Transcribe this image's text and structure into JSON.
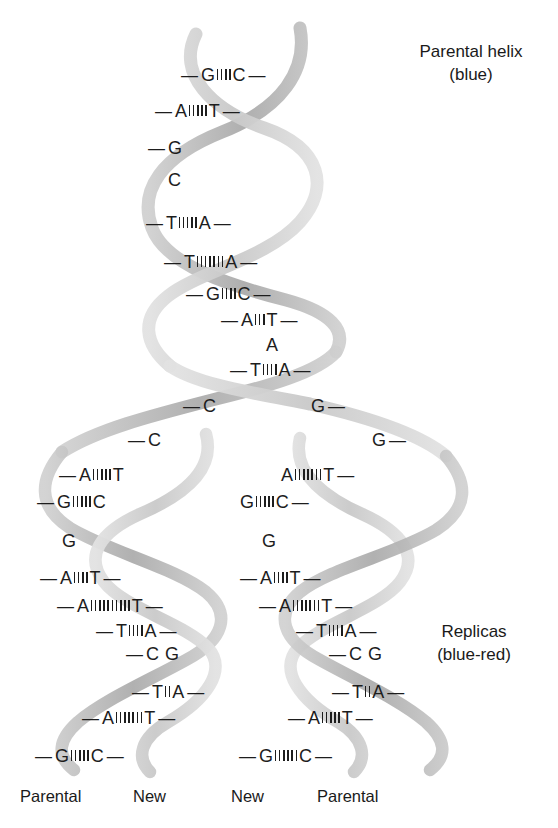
{
  "figure": {
    "title_top_right": "Parental helix",
    "subtitle_top_right": "(blue)",
    "title_bottom_right": "Replicas",
    "subtitle_bottom_right": "(blue-red)"
  },
  "captions": {
    "parental_helix": {
      "line1": "Parental helix",
      "line2": "(blue)"
    },
    "replicas": {
      "line1": "Replicas",
      "line2": "(blue-red)"
    }
  },
  "bottom_labels": [
    {
      "text": "Parental"
    },
    {
      "text": "New"
    },
    {
      "text": "New"
    },
    {
      "text": "Parental"
    }
  ],
  "colors": {
    "background": "#ffffff",
    "text": "#1d1d1d",
    "ribbon_light": "#d2d2d2",
    "ribbon_mid": "#bdbdbd",
    "ribbon_dark": "#a6a6a6",
    "named_parental_color": "blue",
    "named_new_color": "red"
  },
  "parental_helix": {
    "name": "parental-helix",
    "rows": [
      {
        "left_dash": true,
        "left_base": "G",
        "bonds": 4,
        "right_base": "C",
        "right_dash": true,
        "x": 181,
        "y": 67
      },
      {
        "left_dash": true,
        "left_base": "A",
        "bonds": 5,
        "right_base": "T",
        "right_dash": true,
        "x": 155,
        "y": 103
      },
      {
        "left_dash": true,
        "left_base": "G",
        "bonds": 0,
        "right_base": "",
        "right_dash": false,
        "x": 148,
        "y": 140
      },
      {
        "left_dash": false,
        "left_base": "C",
        "bonds": 0,
        "right_base": "",
        "right_dash": false,
        "x": 168,
        "y": 172
      },
      {
        "left_dash": true,
        "left_base": "T",
        "bonds": 5,
        "right_base": "A",
        "right_dash": true,
        "x": 146,
        "y": 215
      },
      {
        "left_dash": true,
        "left_base": "T",
        "bonds": 7,
        "right_base": "A",
        "right_dash": true,
        "x": 164,
        "y": 254
      },
      {
        "left_dash": true,
        "left_base": "G",
        "bonds": 4,
        "right_base": "C",
        "right_dash": true,
        "x": 186,
        "y": 286
      },
      {
        "left_dash": true,
        "left_base": "A",
        "bonds": 3,
        "right_base": "T",
        "right_dash": true,
        "x": 221,
        "y": 312
      },
      {
        "left_dash": false,
        "left_base": "A",
        "bonds": 0,
        "right_base": "",
        "right_dash": false,
        "x": 266,
        "y": 337
      },
      {
        "left_dash": true,
        "left_base": "T",
        "bonds": 4,
        "right_base": "A",
        "right_dash": true,
        "x": 230,
        "y": 362
      }
    ]
  },
  "fork": {
    "name": "replication-fork",
    "left_unpaired": [
      {
        "dash": true,
        "base": "C",
        "x": 183,
        "y": 398
      },
      {
        "dash": true,
        "base": "C",
        "x": 128,
        "y": 432
      }
    ],
    "right_unpaired": [
      {
        "dash_after": true,
        "base": "G",
        "x": 311,
        "y": 398
      },
      {
        "dash_after": true,
        "base": "G",
        "x": 372,
        "y": 432
      }
    ]
  },
  "left_replica": {
    "name": "left-replica-helix",
    "rows": [
      {
        "left_dash": true,
        "left_base": "A",
        "bonds": 5,
        "right_base": "T",
        "right_dash": false,
        "x": 59,
        "y": 467
      },
      {
        "left_dash": true,
        "left_base": "G",
        "bonds": 5,
        "right_base": "C",
        "right_dash": false,
        "x": 37,
        "y": 494
      },
      {
        "left_dash": false,
        "left_base": "G",
        "bonds": 0,
        "right_base": "",
        "right_dash": false,
        "x": 62,
        "y": 533
      },
      {
        "left_dash": true,
        "left_base": "A",
        "bonds": 4,
        "right_base": "T",
        "right_dash": true,
        "x": 40,
        "y": 570
      },
      {
        "left_dash": true,
        "left_base": "A",
        "bonds": 10,
        "right_base": "T",
        "right_dash": true,
        "x": 57,
        "y": 598
      },
      {
        "left_dash": true,
        "left_base": "T",
        "bonds": 4,
        "right_base": "A",
        "right_dash": true,
        "x": 96,
        "y": 623
      },
      {
        "left_dash": true,
        "left_base": "C",
        "bonds": 0,
        "right_base": "G",
        "right_dash": false,
        "x": 126,
        "y": 646
      },
      {
        "left_dash": true,
        "left_base": "T",
        "bonds": 2,
        "right_base": "A",
        "right_dash": true,
        "x": 132,
        "y": 684
      },
      {
        "left_dash": true,
        "left_base": "A",
        "bonds": 7,
        "right_base": "T",
        "right_dash": true,
        "x": 82,
        "y": 710
      },
      {
        "left_dash": true,
        "left_base": "G",
        "bonds": 5,
        "right_base": "C",
        "right_dash": true,
        "x": 35,
        "y": 748
      }
    ]
  },
  "right_replica": {
    "name": "right-replica-helix",
    "rows": [
      {
        "left_dash": false,
        "left_base": "A",
        "bonds": 7,
        "right_base": "T",
        "right_dash": true,
        "x": 281,
        "y": 467
      },
      {
        "left_dash": false,
        "left_base": "G",
        "bonds": 5,
        "right_base": "C",
        "right_dash": true,
        "x": 240,
        "y": 494
      },
      {
        "left_dash": false,
        "left_base": "G",
        "bonds": 0,
        "right_base": "",
        "right_dash": false,
        "x": 262,
        "y": 533
      },
      {
        "left_dash": true,
        "left_base": "A",
        "bonds": 4,
        "right_base": "T",
        "right_dash": true,
        "x": 240,
        "y": 570
      },
      {
        "left_dash": true,
        "left_base": "A",
        "bonds": 7,
        "right_base": "T",
        "right_dash": true,
        "x": 259,
        "y": 598
      },
      {
        "left_dash": true,
        "left_base": "T",
        "bonds": 4,
        "right_base": "A",
        "right_dash": true,
        "x": 296,
        "y": 623
      },
      {
        "left_dash": true,
        "left_base": "C",
        "bonds": 0,
        "right_base": "G",
        "right_dash": false,
        "x": 329,
        "y": 646
      },
      {
        "left_dash": true,
        "left_base": "T",
        "bonds": 2,
        "right_base": "A",
        "right_dash": true,
        "x": 332,
        "y": 684
      },
      {
        "left_dash": true,
        "left_base": "A",
        "bonds": 5,
        "right_base": "T",
        "right_dash": true,
        "x": 288,
        "y": 710
      },
      {
        "left_dash": true,
        "left_base": "G",
        "bonds": 6,
        "right_base": "C",
        "right_dash": true,
        "x": 239,
        "y": 748
      }
    ]
  },
  "sequences": {
    "parental_left_strand": [
      "G",
      "A",
      "G",
      "C",
      "T",
      "T",
      "G",
      "A",
      "A",
      "T"
    ],
    "parental_right_strand": [
      "C",
      "T",
      "",
      "",
      "A",
      "A",
      "C",
      "T",
      "",
      "A"
    ],
    "left_replica_left_strand": [
      "A",
      "G",
      "G",
      "A",
      "A",
      "T",
      "C",
      "T",
      "A",
      "G"
    ],
    "left_replica_right_strand": [
      "T",
      "C",
      "",
      "T",
      "T",
      "A",
      "G",
      "A",
      "T",
      "C"
    ],
    "right_replica_left_strand": [
      "A",
      "G",
      "G",
      "A",
      "A",
      "T",
      "C",
      "T",
      "A",
      "G"
    ],
    "right_replica_right_strand": [
      "T",
      "C",
      "",
      "T",
      "T",
      "A",
      "G",
      "A",
      "T",
      "C"
    ]
  }
}
